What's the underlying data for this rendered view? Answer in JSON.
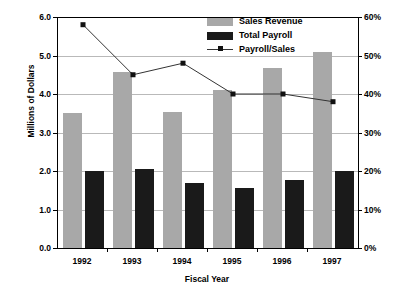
{
  "chart_data": {
    "type": "bar",
    "title": "",
    "xlabel": "Fiscal Year",
    "ylabel": "Millions of Dollars",
    "y2label": "",
    "categories": [
      "1992",
      "1993",
      "1994",
      "1995",
      "1996",
      "1997"
    ],
    "series": [
      {
        "name": "Sales Revenue",
        "type": "bar",
        "axis": "left",
        "color": "#a8a8a8",
        "values": [
          3.5,
          4.58,
          3.53,
          4.1,
          4.67,
          5.1
        ]
      },
      {
        "name": "Total Payroll",
        "type": "bar",
        "axis": "left",
        "color": "#1a1a1a",
        "values": [
          2.0,
          2.04,
          1.68,
          1.57,
          1.76,
          2.01
        ]
      },
      {
        "name": "Payroll/Sales",
        "type": "line",
        "axis": "right",
        "color": "#333333",
        "marker_color": "#111111",
        "values": [
          58,
          45,
          48,
          40,
          40,
          38
        ]
      }
    ],
    "ylim": [
      0,
      6
    ],
    "ytick_labels": [
      "0.0",
      "1.0",
      "2.0",
      "3.0",
      "4.0",
      "5.0",
      "6.0"
    ],
    "ytick_values": [
      0,
      1,
      2,
      3,
      4,
      5,
      6
    ],
    "y2lim": [
      0,
      60
    ],
    "y2tick_labels": [
      "0%",
      "10%",
      "20%",
      "30%",
      "40%",
      "50%",
      "60%"
    ],
    "y2tick_values": [
      0,
      10,
      20,
      30,
      40,
      50,
      60
    ],
    "grid": true,
    "legend_position": "top-center",
    "legend": [
      "Sales Revenue",
      "Total Payroll",
      "Payroll/Sales"
    ]
  }
}
